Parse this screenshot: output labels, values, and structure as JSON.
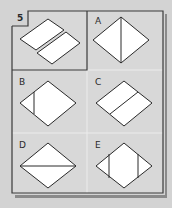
{
  "puzzle": {
    "question_number": "5",
    "question": {
      "label": "5",
      "description": "Diamond divided into two parallel strips by a diagonal gap"
    },
    "options": [
      {
        "label": "A",
        "description": "Diamond with vertical line through center"
      },
      {
        "label": "B",
        "description": "Diamond with short vertical line near left corner"
      },
      {
        "label": "C",
        "description": "Diamond with diagonal line parallel to edges through center"
      },
      {
        "label": "D",
        "description": "Diamond with horizontal line through center"
      },
      {
        "label": "E",
        "description": "Diamond with two vertical lines near left and right corners"
      }
    ]
  },
  "colors": {
    "background": "#d3d3d3",
    "panel": "#d8d8d8",
    "frame": "#3a3a3a",
    "shadow": "#8a8a8a",
    "grid_line": "#ececec",
    "shape_fill": "#ffffff",
    "shape_stroke": "#2a2a2a"
  }
}
